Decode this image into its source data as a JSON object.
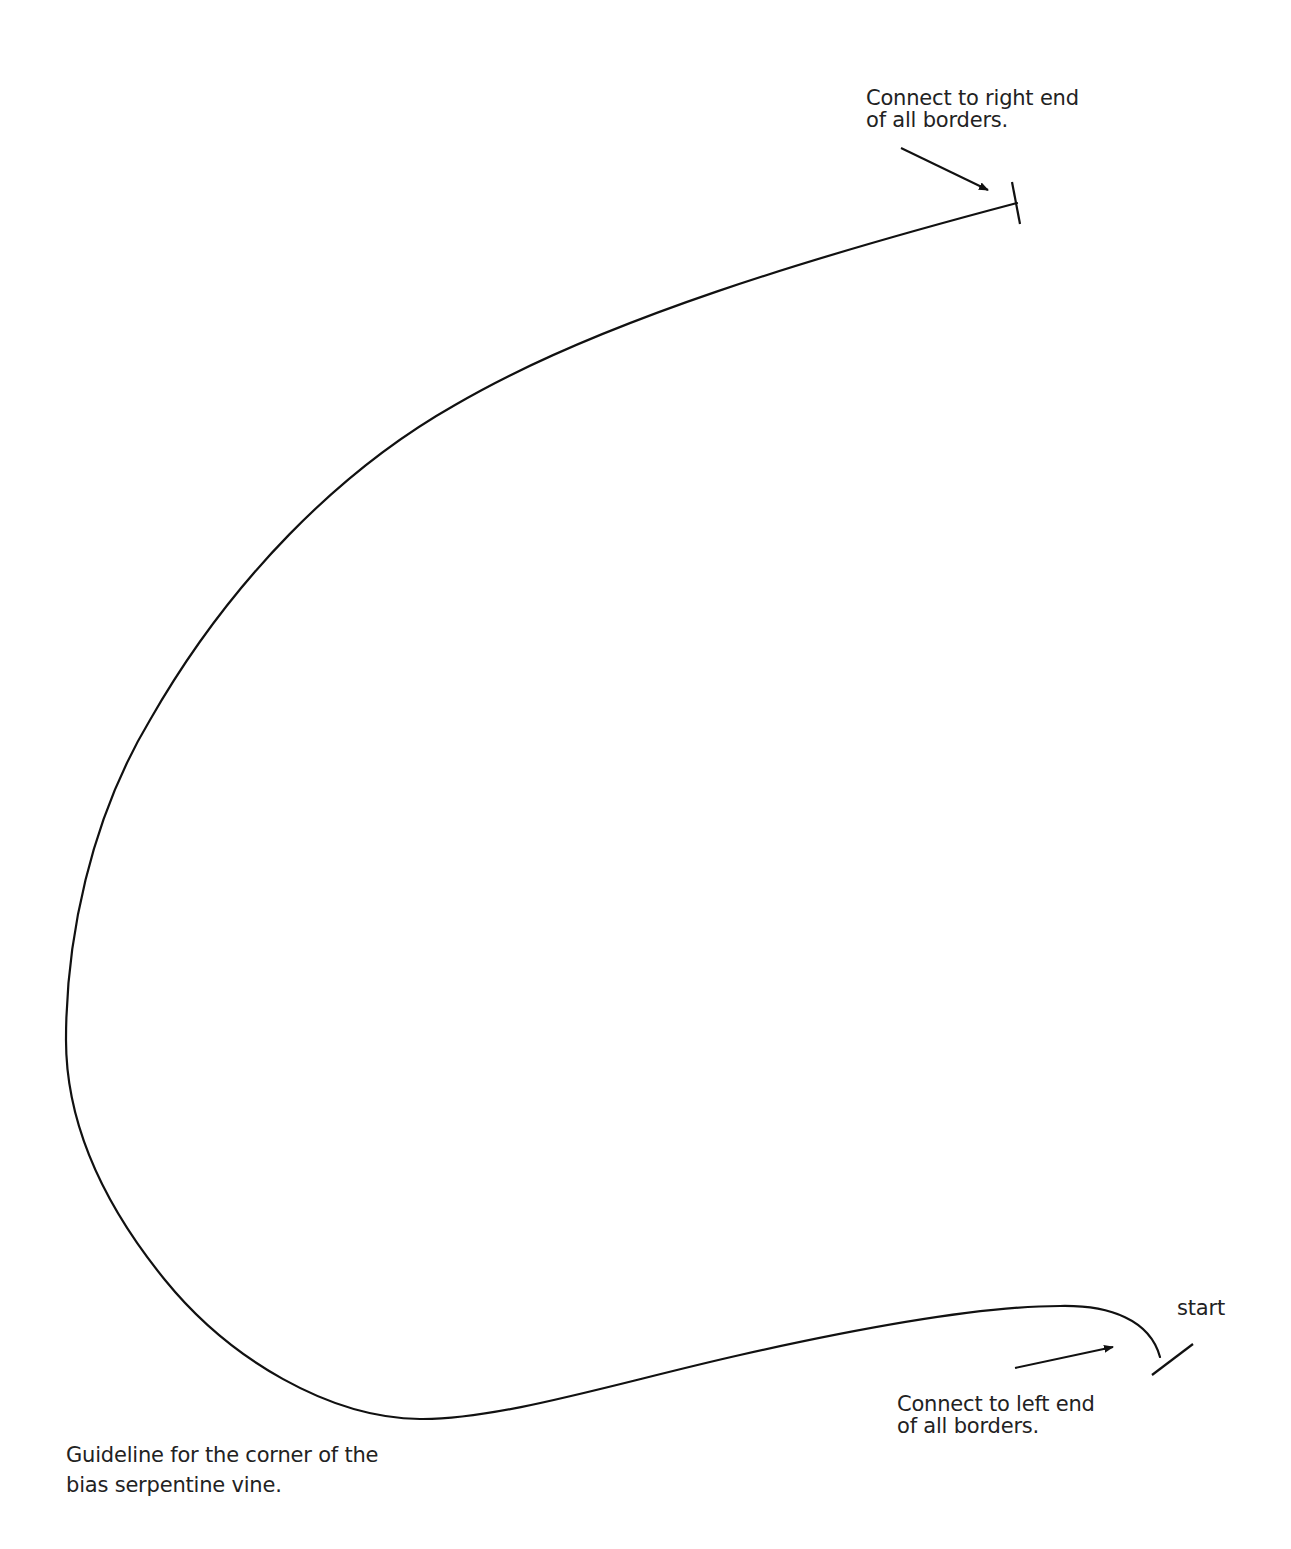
{
  "diagram": {
    "title": "Guideline for the corner of the bias serpentine vine",
    "annotations": {
      "right_end": {
        "line1": "Connect to right end",
        "line2": "of all borders."
      },
      "left_end": {
        "line1": "Connect to left end",
        "line2": "of all borders."
      },
      "start": "start"
    },
    "caption": {
      "line1": "Guideline for the corner of the",
      "line2": "bias serpentine vine."
    },
    "colors": {
      "stroke": "#111111",
      "text": "#222222",
      "background": "#ffffff"
    },
    "elements": [
      {
        "id": "vine-guideline-curve",
        "type": "curve",
        "from": "start-tick",
        "to": "end-tick"
      },
      {
        "id": "end-tick",
        "type": "tick-mark",
        "position": [
          1017,
          203
        ]
      },
      {
        "id": "start-tick",
        "type": "tick-mark",
        "position": [
          1173,
          1362
        ]
      },
      {
        "id": "right-end-arrow",
        "type": "arrow",
        "target": "end-tick"
      },
      {
        "id": "left-end-arrow",
        "type": "arrow",
        "target": "start-tick"
      }
    ]
  }
}
